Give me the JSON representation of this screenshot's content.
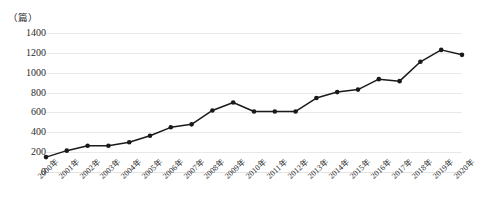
{
  "chart_data": {
    "type": "line",
    "title": "",
    "subtitle": "",
    "xlabel": "",
    "ylabel": "",
    "unit_label": "（篇）",
    "grid": true,
    "legend": "none",
    "ylim": [
      0,
      1400
    ],
    "ytick_step": 200,
    "yticks": [
      "1400",
      "1200",
      "1000",
      "800",
      "600",
      "400",
      "200",
      "0"
    ],
    "categories": [
      "2000年",
      "2001年",
      "2002年",
      "2003年",
      "2004年",
      "2005年",
      "2006年",
      "2007年",
      "2008年",
      "2009年",
      "2010年",
      "2011年",
      "2012年",
      "2013年",
      "2014年",
      "2015年",
      "2016年",
      "2017年",
      "2018年",
      "2019年",
      "2020年"
    ],
    "values": [
      150,
      215,
      265,
      265,
      300,
      365,
      450,
      480,
      620,
      700,
      610,
      610,
      610,
      745,
      805,
      830,
      935,
      915,
      1110,
      1230,
      1180
    ],
    "series": [
      {
        "name": "论文数量",
        "marker": "circle",
        "color": "#1a1a1a",
        "values": [
          150,
          215,
          265,
          265,
          300,
          365,
          450,
          480,
          620,
          700,
          610,
          610,
          610,
          745,
          805,
          830,
          935,
          915,
          1110,
          1230,
          1180
        ]
      }
    ]
  },
  "style": {
    "line_color": "#1a1a1a",
    "marker_color": "#1a1a1a",
    "grid_color": "#e9e9e9",
    "text_color": "#2b2b2b",
    "background": "#ffffff"
  }
}
